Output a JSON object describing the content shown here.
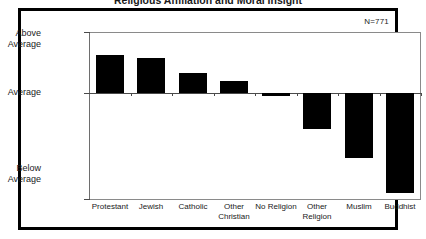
{
  "figure": {
    "title": "Religious Affiliation and Moral Insight",
    "annotation": "N=771",
    "frame_color": "#000000",
    "bar_color": "#000000",
    "panel_border_color": "#8a8a8a"
  },
  "axes": {
    "y_labels": {
      "top": "Above\nAverage",
      "top_line1": "Above",
      "top_line2": "Average",
      "middle": "Average",
      "bottom_line1": "Below",
      "bottom_line2": "Average"
    }
  },
  "chart_data": {
    "type": "bar",
    "title": "Religious Affiliation and Moral Insight",
    "xlabel": "",
    "ylabel": "",
    "categories": [
      "Protestant",
      "Jewish",
      "Catholic",
      "Other Christian",
      "No Religion",
      "Other Religion",
      "Muslim",
      "Buddhist"
    ],
    "category_labels_wrapped": [
      [
        "Protestant"
      ],
      [
        "Jewish"
      ],
      [
        "Catholic"
      ],
      [
        "Other",
        "Christian"
      ],
      [
        "No Religion"
      ],
      [
        "Other",
        "Religion"
      ],
      [
        "Muslim"
      ],
      [
        "Buddhist"
      ]
    ],
    "values": [
      38,
      35,
      20,
      12,
      -3,
      -36,
      -65,
      -100
    ],
    "value_unit": "deviation from average (relative units)",
    "ytick_labels": [
      "Above Average",
      "Average",
      "Below Average"
    ],
    "ylim": [
      -107,
      61
    ],
    "zero_label": "Average",
    "grid": false,
    "legend": null,
    "annotations": [
      {
        "text": "N=771",
        "position": "top-right"
      }
    ],
    "sample_size": 771
  }
}
